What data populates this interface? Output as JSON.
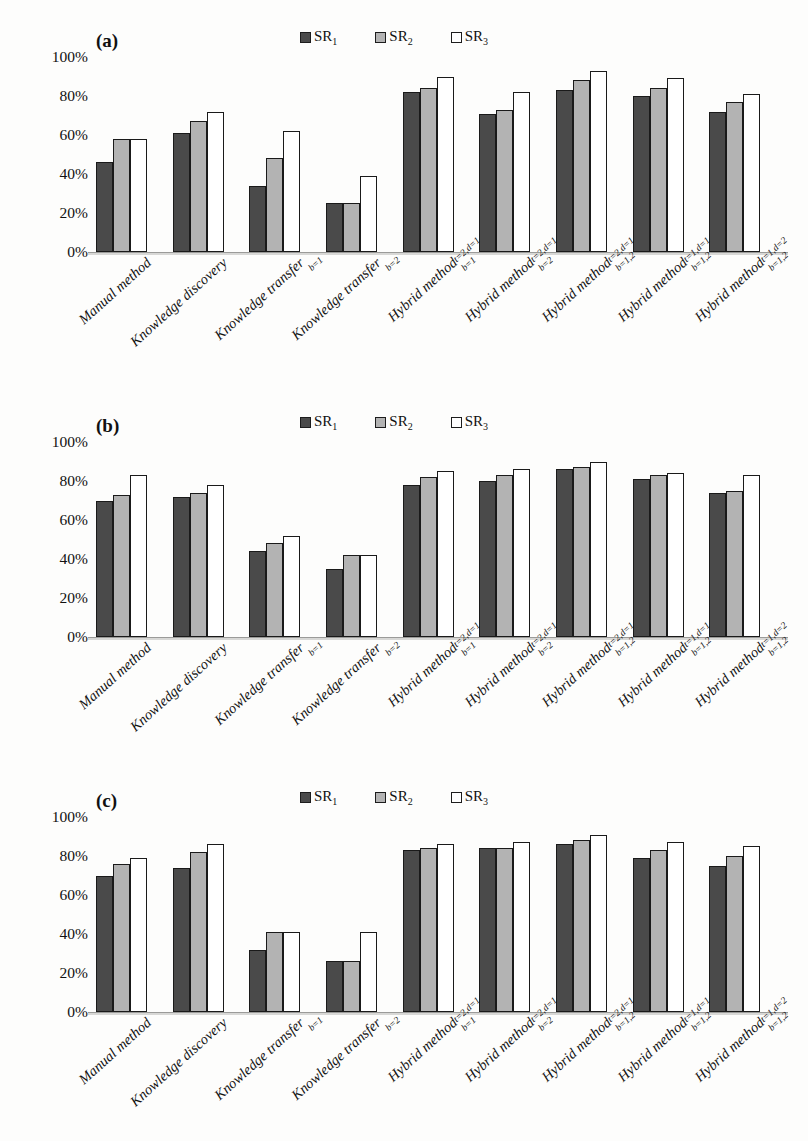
{
  "figure": {
    "panels": [
      "(a)",
      "(b)",
      "(c)"
    ]
  },
  "legend": {
    "items": [
      {
        "key": "SR1",
        "label": "SR",
        "sub": "1",
        "color": "#4a4a4a"
      },
      {
        "key": "SR2",
        "label": "SR",
        "sub": "2",
        "color": "#b3b3b3"
      },
      {
        "key": "SR3",
        "label": "SR",
        "sub": "3",
        "color": "#ffffff"
      }
    ]
  },
  "axis": {
    "yticks": [
      "100%",
      "80%",
      "60%",
      "40%",
      "20%",
      "0%"
    ],
    "ymin": 0,
    "ymax": 100
  },
  "categories": [
    {
      "base": "Manual method",
      "sup": "",
      "sub": ""
    },
    {
      "base": "Knowledge discovery",
      "sup": "",
      "sub": ""
    },
    {
      "base": "Knowledge transfer",
      "sup": "",
      "sub": "b=1"
    },
    {
      "base": "Knowledge transfer",
      "sup": "",
      "sub": "b=2"
    },
    {
      "base": "Hybrid method",
      "sup": "t=2,d=1",
      "sub": "b=1"
    },
    {
      "base": "Hybrid method",
      "sup": "t=2,d=1",
      "sub": "b=2"
    },
    {
      "base": "Hybrid method",
      "sup": "t=2,d=1",
      "sub": "b=1,2"
    },
    {
      "base": "Hybrid method",
      "sup": "t=1,d=1",
      "sub": "b=1,2"
    },
    {
      "base": "Hybrid method",
      "sup": "t=1,d=2",
      "sub": "b=1,2"
    }
  ],
  "chart_data": [
    {
      "type": "bar",
      "title": "(a)",
      "xlabel": "",
      "ylabel": "",
      "ylim": [
        0,
        100
      ],
      "grid": false,
      "legend_position": "top-center",
      "categories": [
        "Manual method",
        "Knowledge discovery",
        "Knowledge transfer_b=1",
        "Knowledge transfer_b=2",
        "Hybrid method^{t=2,d=1}_{b=1}",
        "Hybrid method^{t=2,d=1}_{b=2}",
        "Hybrid method^{t=2,d=1}_{b=1,2}",
        "Hybrid method^{t=1,d=1}_{b=1,2}",
        "Hybrid method^{t=1,d=2}_{b=1,2}"
      ],
      "series": [
        {
          "name": "SR1",
          "values": [
            46,
            61,
            34,
            25,
            82,
            71,
            83,
            80,
            72
          ]
        },
        {
          "name": "SR2",
          "values": [
            58,
            67,
            48,
            25,
            84,
            73,
            88,
            84,
            77
          ]
        },
        {
          "name": "SR3",
          "values": [
            58,
            72,
            62,
            39,
            90,
            82,
            93,
            89,
            81
          ]
        }
      ]
    },
    {
      "type": "bar",
      "title": "(b)",
      "xlabel": "",
      "ylabel": "",
      "ylim": [
        0,
        100
      ],
      "grid": false,
      "legend_position": "top-center",
      "categories": [
        "Manual method",
        "Knowledge discovery",
        "Knowledge transfer_b=1",
        "Knowledge transfer_b=2",
        "Hybrid method^{t=2,d=1}_{b=1}",
        "Hybrid method^{t=2,d=1}_{b=2}",
        "Hybrid method^{t=2,d=1}_{b=1,2}",
        "Hybrid method^{t=1,d=1}_{b=1,2}",
        "Hybrid method^{t=1,d=2}_{b=1,2}"
      ],
      "series": [
        {
          "name": "SR1",
          "values": [
            70,
            72,
            44,
            35,
            78,
            80,
            86,
            81,
            74
          ]
        },
        {
          "name": "SR2",
          "values": [
            73,
            74,
            48,
            42,
            82,
            83,
            87,
            83,
            75
          ]
        },
        {
          "name": "SR3",
          "values": [
            83,
            78,
            52,
            42,
            85,
            86,
            90,
            84,
            83
          ]
        }
      ]
    },
    {
      "type": "bar",
      "title": "(c)",
      "xlabel": "",
      "ylabel": "",
      "ylim": [
        0,
        100
      ],
      "grid": false,
      "legend_position": "top-center",
      "categories": [
        "Manual method",
        "Knowledge discovery",
        "Knowledge transfer_b=1",
        "Knowledge transfer_b=2",
        "Hybrid method^{t=2,d=1}_{b=1}",
        "Hybrid method^{t=2,d=1}_{b=2}",
        "Hybrid method^{t=2,d=1}_{b=1,2}",
        "Hybrid method^{t=1,d=1}_{b=1,2}",
        "Hybrid method^{t=1,d=2}_{b=1,2}"
      ],
      "series": [
        {
          "name": "SR1",
          "values": [
            70,
            74,
            32,
            26,
            83,
            84,
            86,
            79,
            75
          ]
        },
        {
          "name": "SR2",
          "values": [
            76,
            82,
            41,
            26,
            84,
            84,
            88,
            83,
            80
          ]
        },
        {
          "name": "SR3",
          "values": [
            79,
            86,
            41,
            41,
            86,
            87,
            91,
            87,
            85
          ]
        }
      ]
    }
  ]
}
